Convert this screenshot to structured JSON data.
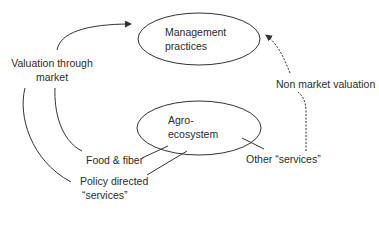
{
  "diagram": {
    "nodes": {
      "management": {
        "line1": "Management",
        "line2": "practices"
      },
      "agro": {
        "line1": "Agro-",
        "line2": "ecosystem"
      }
    },
    "labels": {
      "valuation_market": {
        "line1": "Valuation through",
        "line2": "market"
      },
      "non_market": "Non market valuation",
      "food_fiber": "Food & fiber",
      "policy": {
        "line1": "Policy directed",
        "line2": "“services”"
      },
      "other_services": "Other “services”"
    },
    "edges": [
      {
        "from": "agro",
        "to": "food_fiber",
        "style": "solid"
      },
      {
        "from": "agro",
        "to": "policy",
        "style": "solid"
      },
      {
        "from": "agro",
        "to": "other_services",
        "style": "solid"
      },
      {
        "from": "food_fiber",
        "to": "valuation_market",
        "style": "solid"
      },
      {
        "from": "policy",
        "to": "valuation_market",
        "style": "solid"
      },
      {
        "from": "valuation_market",
        "to": "management",
        "style": "solid-arrow"
      },
      {
        "from": "other_services",
        "to": "non_market",
        "style": "dashed"
      },
      {
        "from": "non_market",
        "to": "management",
        "style": "dashed-arrow"
      }
    ],
    "colors": {
      "stroke": "#333333",
      "text": "#2b2b2b",
      "background": "#ffffff"
    }
  }
}
